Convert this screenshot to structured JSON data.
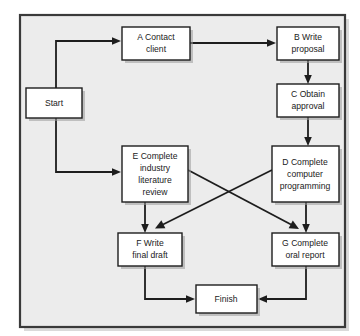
{
  "diagram": {
    "background_color": "#ececec",
    "page_color": "#ffffff",
    "line_color": "#1d1d1d",
    "node_fill": "#ffffff",
    "node_stroke": "#1d1d1d",
    "panel": {
      "x": 20,
      "y": 15,
      "width": 325,
      "height": 312
    },
    "nodes": [
      {
        "id": "start",
        "name": "start-node",
        "x": 26,
        "y": 88,
        "w": 56,
        "h": 30,
        "lines": [
          "Start"
        ]
      },
      {
        "id": "a",
        "name": "node-a-contact-client",
        "x": 122,
        "y": 27,
        "w": 68,
        "h": 33,
        "lines": [
          "A Contact",
          "client"
        ]
      },
      {
        "id": "b",
        "name": "node-b-write-proposal",
        "x": 277,
        "y": 27,
        "w": 62,
        "h": 33,
        "lines": [
          "B Write",
          "proposal"
        ]
      },
      {
        "id": "c",
        "name": "node-c-obtain-approval",
        "x": 277,
        "y": 84,
        "w": 62,
        "h": 33,
        "lines": [
          "C Obtain",
          "approval"
        ]
      },
      {
        "id": "e",
        "name": "node-e-industry-literature-review",
        "x": 122,
        "y": 146,
        "w": 66,
        "h": 56,
        "lines": [
          "E Complete",
          "industry",
          "literature",
          "review"
        ]
      },
      {
        "id": "d",
        "name": "node-d-computer-programming",
        "x": 272,
        "y": 146,
        "w": 67,
        "h": 56,
        "lines": [
          "D Complete",
          "computer",
          "programming"
        ]
      },
      {
        "id": "f",
        "name": "node-f-write-final-draft",
        "x": 118,
        "y": 233,
        "w": 64,
        "h": 33,
        "lines": [
          "F Write",
          "final draft"
        ]
      },
      {
        "id": "g",
        "name": "node-g-complete-oral-report",
        "x": 272,
        "y": 233,
        "w": 67,
        "h": 33,
        "lines": [
          "G Complete",
          "oral report"
        ]
      },
      {
        "id": "finish",
        "name": "finish-node",
        "x": 196,
        "y": 285,
        "w": 61,
        "h": 28,
        "lines": [
          "Finish"
        ]
      }
    ],
    "edges": [
      {
        "name": "edge-start-to-a",
        "from": "start",
        "to": "a",
        "path": "M56,103 L56,41 L117,41",
        "arrow": "right"
      },
      {
        "name": "edge-start-to-e",
        "from": "start",
        "to": "e",
        "path": "M56,103 L56,172 L117,172",
        "arrow": "right"
      },
      {
        "name": "edge-a-to-b",
        "from": "a",
        "to": "b",
        "path": "M190,43 L272,43",
        "arrow": "right"
      },
      {
        "name": "edge-b-to-c",
        "from": "b",
        "to": "c",
        "path": "M308,60 L308,79",
        "arrow": "down"
      },
      {
        "name": "edge-c-to-d",
        "from": "c",
        "to": "d",
        "path": "M308,117 L308,141",
        "arrow": "down"
      },
      {
        "name": "edge-e-to-f",
        "from": "e",
        "to": "f",
        "path": "M145,202 L145,228",
        "arrow": "down"
      },
      {
        "name": "edge-d-to-g",
        "from": "d",
        "to": "g",
        "path": "M306,202 L306,228",
        "arrow": "down"
      },
      {
        "name": "edge-e-to-g",
        "from": "e",
        "to": "g",
        "path": "M188,170 L298,228",
        "arrow": "diagonal-down-right"
      },
      {
        "name": "edge-d-to-f",
        "from": "d",
        "to": "f",
        "path": "M272,170 L157,228",
        "arrow": "diagonal-down-left"
      },
      {
        "name": "edge-f-to-finish",
        "from": "f",
        "to": "finish",
        "path": "M145,266 L145,299 L191,299",
        "arrow": "right"
      },
      {
        "name": "edge-g-to-finish",
        "from": "g",
        "to": "finish",
        "path": "M306,266 L306,299 L262,299",
        "arrow": "left"
      }
    ]
  }
}
